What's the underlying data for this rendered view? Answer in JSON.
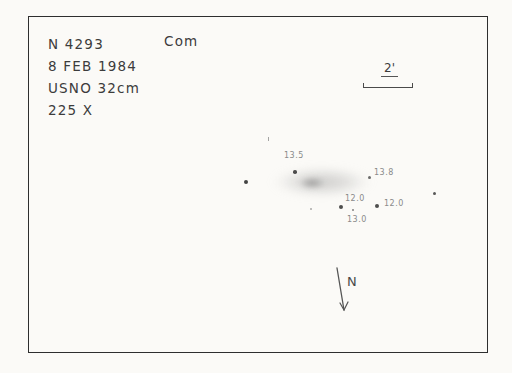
{
  "colors": {
    "paper": "#fbfaf7",
    "ink": "#3c3c3c",
    "pencil": "#8a8a8a",
    "frame": "#2e2e2e"
  },
  "header": {
    "object": "N 4293",
    "constellation": "Com",
    "date": "8 FEB 1984",
    "telescope": "USNO 32cm",
    "magnification": "225 X"
  },
  "scale_bar": {
    "label": "2'"
  },
  "compass": {
    "label": "N"
  },
  "sketch": {
    "galaxy": {
      "cx": 322,
      "cy": 182,
      "rx": 51,
      "ry": 15,
      "core_cx": 312,
      "core_cy": 183,
      "core_rx": 13,
      "core_ry": 6
    },
    "stars": [
      {
        "x": 246,
        "y": 182,
        "r": 2.2,
        "o": 0.9,
        "label": ""
      },
      {
        "x": 295,
        "y": 172,
        "r": 1.8,
        "o": 0.85,
        "label": "13.5",
        "lx": 284,
        "ly": 151
      },
      {
        "x": 369,
        "y": 177,
        "r": 1.5,
        "o": 0.7,
        "label": "13.8",
        "lx": 374,
        "ly": 168
      },
      {
        "x": 341,
        "y": 207,
        "r": 2.0,
        "o": 0.85,
        "label": "12.0",
        "lx": 345,
        "ly": 194
      },
      {
        "x": 377,
        "y": 206,
        "r": 2.0,
        "o": 0.85,
        "label": "12.0",
        "lx": 384,
        "ly": 199
      },
      {
        "x": 353,
        "y": 210,
        "r": 1.2,
        "o": 0.6,
        "label": "13.0",
        "lx": 347,
        "ly": 215
      },
      {
        "x": 311,
        "y": 209,
        "r": 1.0,
        "o": 0.4,
        "label": ""
      },
      {
        "x": 434,
        "y": 193,
        "r": 1.5,
        "o": 0.8,
        "label": ""
      },
      {
        "x": 268,
        "y": 139,
        "r": 0.0,
        "o": 0.6,
        "label": "",
        "tick": true
      }
    ]
  }
}
